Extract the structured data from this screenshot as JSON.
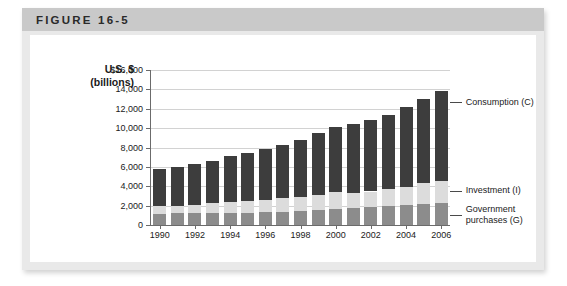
{
  "figure": {
    "title": "FIGURE 16-5"
  },
  "axis": {
    "y_title_line1": "U.S. $",
    "y_title_line2": "(billions)"
  },
  "callouts": [
    {
      "name": "consumption",
      "lines": [
        "Consumption (C)"
      ]
    },
    {
      "name": "investment",
      "lines": [
        "Investment (I)"
      ]
    },
    {
      "name": "government-purchases",
      "lines": [
        "Government",
        "purchases (G)"
      ]
    }
  ],
  "colors": {
    "consumption": "#3d3d3d",
    "investment": "#dcdcdc",
    "government": "#8c8c8c",
    "gridline": "#d2d2d2",
    "axis": "#6b6b6b",
    "titlebar": "#c9c9c9",
    "card": "#e9e9e9",
    "plate": "#ffffff",
    "text": "#1a1a1a"
  },
  "chart_data": {
    "type": "bar",
    "stacked": true,
    "title": "FIGURE 16-5",
    "xlabel": "",
    "ylabel": "U.S. $ (billions)",
    "ylim": [
      0,
      16000
    ],
    "ytick_labels": [
      "$16,000",
      "14,000",
      "12,000",
      "10,000",
      "8,000",
      "6,000",
      "4,000",
      "2,000",
      "0"
    ],
    "yticks": [
      16000,
      14000,
      12000,
      10000,
      8000,
      6000,
      4000,
      2000,
      0
    ],
    "grid": true,
    "legend_position": "right-callouts",
    "x": [
      1990,
      1991,
      1992,
      1993,
      1994,
      1995,
      1996,
      1997,
      1998,
      1999,
      2000,
      2001,
      2002,
      2003,
      2004,
      2005,
      2006
    ],
    "xtick_labels": [
      "1990",
      "1992",
      "1994",
      "1996",
      "1998",
      "2000",
      "2002",
      "2004",
      "2006"
    ],
    "xticks": [
      1990,
      1992,
      1994,
      1996,
      1998,
      2000,
      2002,
      2004,
      2006
    ],
    "series": [
      {
        "name": "Government purchases (G)",
        "color": "#8c8c8c",
        "values": [
          1180,
          1200,
          1210,
          1220,
          1250,
          1280,
          1320,
          1380,
          1440,
          1530,
          1620,
          1720,
          1840,
          1960,
          2080,
          2220,
          2320
        ]
      },
      {
        "name": "Investment (I)",
        "color": "#dcdcdc",
        "values": [
          820,
          790,
          860,
          1010,
          1110,
          1150,
          1260,
          1360,
          1500,
          1580,
          1740,
          1600,
          1620,
          1710,
          1880,
          2080,
          2220
        ]
      },
      {
        "name": "Consumption (C)",
        "color": "#3d3d3d",
        "values": [
          3830,
          3990,
          4200,
          4420,
          4740,
          5010,
          5240,
          5560,
          5860,
          6360,
          6740,
          7060,
          7330,
          7700,
          8260,
          8720,
          9310
        ]
      }
    ],
    "totals": [
      5830,
      5980,
      6270,
      6650,
      7100,
      7440,
      7820,
      8300,
      8800,
      9470,
      10100,
      10380,
      10790,
      11370,
      12220,
      13020,
      13850
    ]
  }
}
